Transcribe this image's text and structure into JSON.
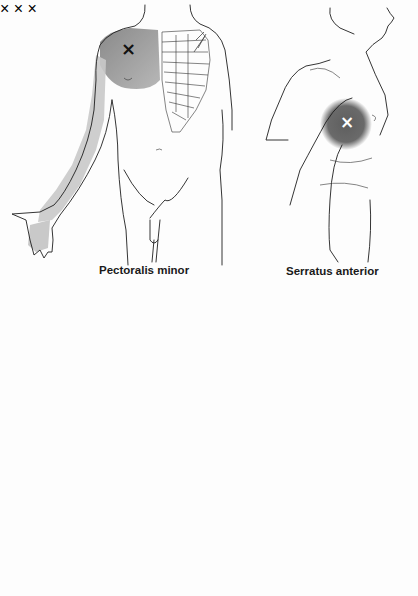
{
  "figure": {
    "panels": [
      {
        "id": "pectoralis-minor",
        "label": "Pectoralis minor",
        "view": "anterior torso, right arm abducted",
        "trigger_point_marker": "×",
        "marker_color": "#111111",
        "referral_zones": [
          "anterior shoulder and chest (dark)",
          "ulnar arm, forearm and hand (light)"
        ]
      },
      {
        "id": "serratus-anterior",
        "label": "Serratus anterior",
        "view": "lateral torso",
        "trigger_point_marker": "×",
        "marker_color": "#ffffff",
        "referral_zones": [
          "lateral chest wall (dark)"
        ]
      },
      {
        "id": "serratus-anterior-posterior",
        "label": "",
        "view": "posterior torso with arm",
        "trigger_point_marker": "×",
        "marker_color": "#111111",
        "referral_zones": [
          "inferior scapula (dark)",
          "medial arm and forearm to ring/little fingers (light)"
        ]
      },
      {
        "id": "serratus-posterior-inferior-lateral",
        "label": "",
        "view": "lateral torso",
        "trigger_point_marker": "×",
        "marker_color": "#111111",
        "referral_zones": [
          "lateral chest (light)",
          "lower flank (light)"
        ]
      },
      {
        "id": "anterior-arm-view",
        "label": "",
        "view": "anterior torso with arm",
        "trigger_point_marker": "×",
        "marker_color": "#111111",
        "referral_zones": [
          "medial upper arm (light)",
          "forearm (light)",
          "wrist/hand (light)"
        ]
      }
    ],
    "colors": {
      "background": "#fdfdfd",
      "outline": "#1e1e1e",
      "dark_zone": "#6a6a6a",
      "medium_zone": "#a8a8a8",
      "light_zone": "#cfcfcf"
    }
  }
}
